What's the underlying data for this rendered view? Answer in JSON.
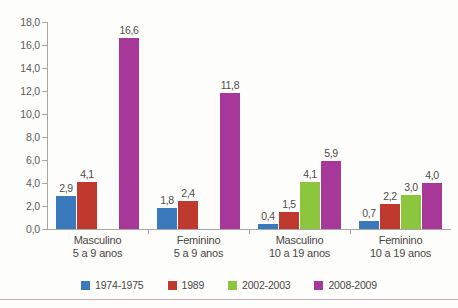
{
  "chart_data": {
    "type": "bar",
    "title": "",
    "subtitle": "",
    "xlabel": "",
    "ylabel": "",
    "ylim": [
      0,
      18
    ],
    "ytick_step": 2,
    "grid": false,
    "legend_position": "bottom",
    "ytick_labels": [
      "0,0",
      "2,0",
      "4,0",
      "6,0",
      "8,0",
      "10,0",
      "12,0",
      "14,0",
      "16,0",
      "18,0"
    ],
    "categories": [
      {
        "line1": "Masculino",
        "line2": "5 a 9 anos"
      },
      {
        "line1": "Feminino",
        "line2": "5 a 9 anos"
      },
      {
        "line1": "Masculino",
        "line2": "10 a 19 anos"
      },
      {
        "line1": "Feminino",
        "line2": "10 a 19 anos"
      }
    ],
    "series": [
      {
        "name": "1974-1975",
        "color": "#3b79bd",
        "values": [
          2.9,
          1.8,
          0.4,
          0.7
        ],
        "labels": [
          "2,9",
          "1,8",
          "0,4",
          "0,7"
        ]
      },
      {
        "name": "1989",
        "color": "#c0392f",
        "values": [
          4.1,
          2.4,
          1.5,
          2.2
        ],
        "labels": [
          "4,1",
          "2,4",
          "1,5",
          "2,2"
        ]
      },
      {
        "name": "2002-2003",
        "color": "#8cc63e",
        "values": [
          null,
          null,
          4.1,
          3.0
        ],
        "labels": [
          "",
          "",
          "4,1",
          "3,0"
        ]
      },
      {
        "name": "2008-2009",
        "color": "#a8379a",
        "values": [
          16.6,
          11.8,
          5.9,
          4.0
        ],
        "labels": [
          "16,6",
          "11,8",
          "5,9",
          "4,0"
        ]
      }
    ]
  },
  "colors": {
    "axis": "#a9a7a5",
    "tick_text": "#5d5b59",
    "category_text": "#4a4846",
    "data_label_text": "#4f4d4b",
    "background": "#fdfdfb",
    "bottom_rule": "#c9aec4"
  }
}
